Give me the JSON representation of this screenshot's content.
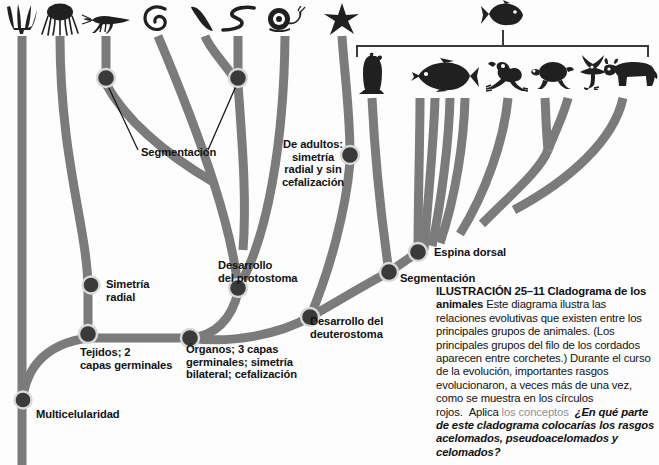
{
  "figure": {
    "type": "cladogram",
    "language": "es",
    "background_color": "#fdfdfd",
    "branch_color": "#7b7b7b",
    "node_color": "#3a3a3a",
    "node_ring_color": "#d8d8d8",
    "text_color": "#111111",
    "accent_text_color": "#8f9296"
  },
  "labels": {
    "multicellularity": "Multicelularidad",
    "tissues": "Tejidos; 2\ncapas germinales",
    "radial_symmetry": "Simetría\nradial",
    "organs": "Órganos; 3 capas\ngerminales; simetría\nbilateral; cefalización",
    "segmentation_left": "Segmentación",
    "protostome": "Desarrollo\ndel protostoma",
    "adult_radial": "De adultos:\nsimetría\nradial y sin\ncefalización",
    "deuterostome": "Desarrollo del\ndeuterostoma",
    "backbone": "Espina dorsal",
    "segmentation_right": "Segmentación"
  },
  "caption": {
    "figure_number": "ILUSTRACIÓN 25–11",
    "title": "Cladograma de los animales",
    "body": "Este diagrama ilustra las relaciones evolutivas que existen entre los principales grupos de animales. (Los principales grupos del filo de los cordados aparecen entre corchetes.) Durante el curso de la evolución, importantes rasgos evolucionaron, a veces más de una vez, como se muestra en los círculos rojos.",
    "apply_label": "los conceptos",
    "apply_prefix": "Aplica",
    "question": "¿En qué parte de este cladograma colocarías los rasgos acelomados, pseudoacelomados y celomados?"
  },
  "taxa": [
    {
      "name": "sponge",
      "label": "Poríferos",
      "x": 22
    },
    {
      "name": "jellyfish",
      "label": "Cnidarios",
      "x": 60
    },
    {
      "name": "grasshopper",
      "label": "Artrópodos",
      "x": 106
    },
    {
      "name": "flatworm",
      "label": "Platelmintos",
      "x": 158
    },
    {
      "name": "annelid",
      "label": "Anélidos",
      "x": 205
    },
    {
      "name": "roundworm",
      "label": "Nematodos",
      "x": 238
    },
    {
      "name": "snail",
      "label": "Moluscos",
      "x": 285
    },
    {
      "name": "starfish",
      "label": "Equinodermos",
      "x": 342
    },
    {
      "name": "tunicate",
      "label": "Urocordados",
      "x": 372
    },
    {
      "name": "lancelet-fish",
      "label": "Peces",
      "x": 443
    },
    {
      "name": "frog",
      "label": "Anfibios",
      "x": 508
    },
    {
      "name": "turtle",
      "label": "Reptiles",
      "x": 553
    },
    {
      "name": "bird",
      "label": "Aves",
      "x": 593
    },
    {
      "name": "cow",
      "label": "Mamíferos",
      "x": 630
    }
  ],
  "bracket": {
    "name": "chordate-bracket",
    "left_x": 357,
    "right_x": 648,
    "y": 46,
    "stem_x": 503
  },
  "nodes": [
    {
      "name": "node-multicellularity",
      "x": 23,
      "y": 400,
      "r": 8
    },
    {
      "name": "node-tissues",
      "x": 88,
      "y": 334,
      "r": 9
    },
    {
      "name": "node-radial-symmetry",
      "x": 91,
      "y": 285,
      "r": 8
    },
    {
      "name": "node-organs",
      "x": 190,
      "y": 338,
      "r": 9
    },
    {
      "name": "node-segmentation-arthropod",
      "x": 106,
      "y": 78,
      "r": 9
    },
    {
      "name": "node-segmentation-annelid",
      "x": 238,
      "y": 78,
      "r": 9
    },
    {
      "name": "node-protostome",
      "x": 238,
      "y": 288,
      "r": 9
    },
    {
      "name": "node-adult-radial",
      "x": 350,
      "y": 155,
      "r": 9
    },
    {
      "name": "node-deuterostome",
      "x": 310,
      "y": 317,
      "r": 9
    },
    {
      "name": "node-backbone",
      "x": 418,
      "y": 252,
      "r": 9
    },
    {
      "name": "node-segmentation-chordate",
      "x": 389,
      "y": 272,
      "r": 9
    }
  ]
}
